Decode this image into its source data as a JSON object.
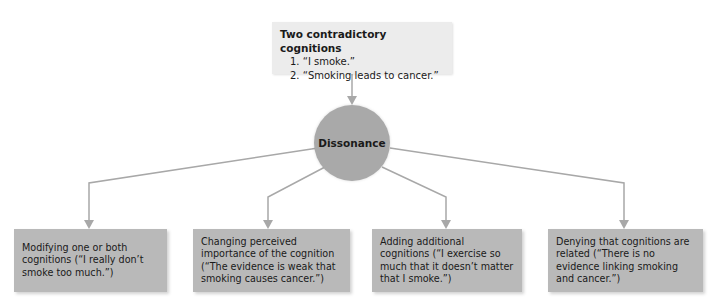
{
  "top_box": {
    "title": "Two contradictory cognitions",
    "items": [
      "1. “I smoke.”",
      "2. “Smoking leads to cancer.”"
    ]
  },
  "center": {
    "label": "Dissonance"
  },
  "outcomes": [
    {
      "text": "Modifying one or both cognitions (“I really don’t smoke too much.”)"
    },
    {
      "text": "Changing perceived importance of the cognition (“The evidence is weak that smoking causes cancer.”)"
    },
    {
      "text": "Adding additional cognitions (“I exercise so much that it doesn’t matter that I smoke.”)"
    },
    {
      "text": "Denying that cognitions are related (“There is no evidence linking smoking and cancer.”)"
    }
  ],
  "colors": {
    "connector": "#a8a8a8",
    "circle": "#a9a9a9",
    "outcome_box": "#b9b9b9",
    "top_box": "#ececec"
  }
}
